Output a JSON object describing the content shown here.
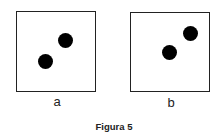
{
  "figure": {
    "caption": "Figura 5",
    "panels": [
      {
        "id": "a",
        "label": "a",
        "dot_count": 2
      },
      {
        "id": "b",
        "label": "b",
        "dot_count": 2
      }
    ],
    "colors": {
      "stroke": "#222222",
      "dot": "#000000",
      "background": "#ffffff"
    }
  }
}
